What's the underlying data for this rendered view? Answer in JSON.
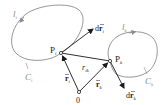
{
  "diagram": {
    "type": "two-loop vector geometry",
    "colors": {
      "curve": "#8a8a8a",
      "vector": "#1a1a1a",
      "label": "#222222",
      "curve_label": "#8a8a8a"
    },
    "loops": [
      {
        "id": "i",
        "direction_label": "l",
        "direction_sub": "i",
        "curve_label": "C",
        "curve_sub": "i"
      },
      {
        "id": "k",
        "direction_label": "l",
        "direction_sub": "k",
        "curve_label": "C",
        "curve_sub": "k"
      }
    ],
    "points": {
      "Pi": {
        "label": "P",
        "sub": "i"
      },
      "Pk": {
        "label": "P",
        "sub": "k"
      },
      "origin": {
        "label": "0"
      }
    },
    "vectors": {
      "r_i": {
        "label": "r",
        "sub": "i"
      },
      "r_k": {
        "label": "r",
        "sub": "k"
      },
      "r_ik": {
        "label": "r",
        "sub": "ik"
      },
      "dr_i": {
        "prefix": "d",
        "label": "r",
        "sub": "i"
      },
      "dr_k": {
        "prefix": "d",
        "label": "r",
        "sub": "k"
      }
    }
  }
}
